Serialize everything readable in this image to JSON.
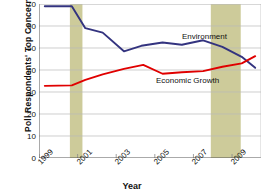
{
  "chart_data": {
    "type": "line",
    "title": "",
    "xlabel": "Year",
    "ylabel": "Poll Respondents' Top Concern",
    "xlim": [
      1999,
      2010.5
    ],
    "ylim": [
      0,
      70
    ],
    "ytick_values": [
      0,
      10,
      20,
      30,
      40,
      50,
      60,
      70
    ],
    "ytick_labels": [
      "0",
      "10",
      "20",
      "30",
      "40",
      "50",
      "60",
      "70"
    ],
    "xtick_values": [
      1999,
      2001,
      2003,
      2005,
      2007,
      2009
    ],
    "xtick_labels": [
      "1999",
      "2001",
      "2003",
      "2005",
      "2007",
      "2009"
    ],
    "grid": "horizontal",
    "legend_position": "inline-annotations",
    "series": [
      {
        "name": "Environment",
        "color": "#33337f",
        "x": [
          1999.3,
          2000.7,
          2001.4,
          2002.3,
          2003.4,
          2004.3,
          2005.4,
          2006.4,
          2007.5,
          2008.5,
          2009.5,
          2010.2
        ],
        "values": [
          69,
          69,
          59,
          57,
          48.5,
          51,
          52.5,
          51.5,
          53.5,
          50.5,
          46,
          41
        ]
      },
      {
        "name": "Economic Growth",
        "color": "#e00000",
        "x": [
          1999.3,
          2000.7,
          2001.4,
          2002.3,
          2003.4,
          2004.4,
          2005.4,
          2006.4,
          2007.5,
          2008.5,
          2009.5,
          2010.2
        ],
        "values": [
          32.8,
          33,
          35.5,
          38,
          40.5,
          42.3,
          38.3,
          39,
          39.5,
          41.5,
          43,
          46.3
        ]
      }
    ],
    "shaded_bands": [
      {
        "name": "recession-band-2001",
        "x0": 2000.6,
        "x1": 2001.25,
        "color": "#cdcb9a"
      },
      {
        "name": "recession-band-2008",
        "x0": 2007.9,
        "x1": 2009.45,
        "color": "#cdcb9a"
      }
    ],
    "annotations": [
      {
        "name": "environment-label",
        "text": "Environment"
      },
      {
        "name": "economic-growth-label",
        "text": "Economic Growth"
      }
    ]
  }
}
